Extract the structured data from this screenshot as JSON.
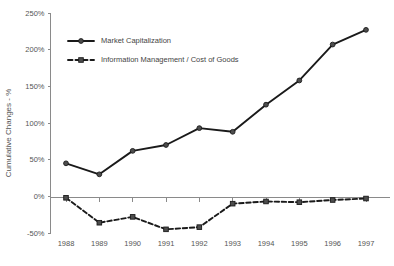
{
  "chart_data": {
    "type": "line",
    "title": "",
    "subtitle": "",
    "xlabel": "",
    "ylabel": "Cumulative Changes - %",
    "categories": [
      "1988",
      "1989",
      "1990",
      "1991",
      "1992",
      "1993",
      "1994",
      "1995",
      "1996",
      "1997"
    ],
    "x": [
      1988,
      1989,
      1990,
      1991,
      1992,
      1993,
      1994,
      1995,
      1996,
      1997
    ],
    "ylim": [
      -50,
      250
    ],
    "ytick_labels": [
      "-50%",
      "0%",
      "50%",
      "100%",
      "150%",
      "200%",
      "250%"
    ],
    "ytick_values": [
      -50,
      0,
      50,
      100,
      150,
      200,
      250
    ],
    "grid": false,
    "legend_position": "upper-left-inside",
    "series": [
      {
        "name": "Market Capitalization",
        "style": "solid",
        "marker": "circle",
        "color": "#1a1a1a",
        "values": [
          45,
          30,
          62,
          70,
          93,
          88,
          125,
          158,
          207,
          227
        ]
      },
      {
        "name": "Information Management / Cost of Goods",
        "style": "dashed",
        "marker": "square",
        "color": "#1a1a1a",
        "values": [
          -2,
          -36,
          -28,
          -45,
          -42,
          -10,
          -7,
          -8,
          -5,
          -3
        ]
      }
    ]
  },
  "legend": {
    "entries": [
      {
        "label": "Market Capitalization"
      },
      {
        "label": "Information Management / Cost of Goods"
      }
    ]
  },
  "axes": {
    "y_title": "Cumulative Changes - %"
  },
  "colors": {
    "series_primary": "#1a1a1a",
    "series_secondary": "#1a1a1a",
    "axis": "#8a8a8a",
    "text": "#555555",
    "background": "#ffffff"
  }
}
